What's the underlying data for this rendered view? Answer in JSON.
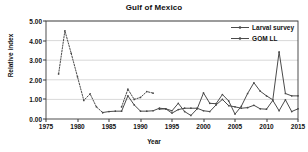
{
  "chart_data": {
    "type": "line",
    "title": "Gulf of Mexico",
    "xlabel": "Year",
    "ylabel": "Relative index",
    "xlim": [
      1975,
      2015
    ],
    "ylim": [
      0.0,
      5.0
    ],
    "xticks": [
      "1975",
      "1980",
      "1985",
      "1990",
      "1995",
      "2000",
      "2005",
      "2010",
      "2015"
    ],
    "xtick_values": [
      1975,
      1980,
      1985,
      1990,
      1995,
      2000,
      2005,
      2010,
      2015
    ],
    "yticks": [
      "0.00",
      "1.00",
      "2.00",
      "3.00",
      "4.00",
      "5.00"
    ],
    "ytick_values": [
      0,
      1,
      2,
      3,
      4,
      5
    ],
    "grid": "horizontal",
    "legend_position": "top-right-inside",
    "line_color": "#4a4a4a",
    "grid_color": "#c8c8c8",
    "axis_color": "#3a3a3a",
    "series": [
      {
        "name": "Larval survey",
        "style": "dotted",
        "marker": "dot",
        "segments": [
          {
            "x": [
              1977,
              1978,
              1979,
              1980,
              1981,
              1982,
              1983,
              1984
            ],
            "y": [
              2.3,
              4.5,
              3.35,
              2.15,
              0.95,
              1.28,
              0.62,
              0.33
            ]
          },
          {
            "x": [
              1987,
              1988,
              1989,
              1990,
              1991,
              1992
            ],
            "y": [
              0.62,
              1.52,
              1.0,
              1.1,
              1.4,
              1.32
            ]
          }
        ]
      },
      {
        "name": "GOM LL",
        "style": "solid",
        "marker": "dot",
        "x": [
          1984,
          1985,
          1986,
          1987,
          1988,
          1989,
          1990,
          1991,
          1992,
          1993,
          1994,
          1995,
          1996,
          1997,
          1998,
          1999,
          2000,
          2001,
          2002,
          2003,
          2004,
          2005,
          2006,
          2007,
          2008,
          2009,
          2010,
          2011,
          2012,
          2013,
          2014,
          2015
        ],
        "y": [
          0.33,
          0.38,
          0.4,
          0.4,
          1.18,
          0.72,
          0.4,
          0.4,
          0.42,
          0.55,
          0.52,
          0.42,
          0.8,
          0.38,
          0.18,
          0.52,
          1.33,
          0.8,
          0.78,
          1.25,
          0.92,
          0.25,
          0.65,
          1.3,
          1.85,
          1.42,
          1.18,
          0.98,
          3.42,
          1.3,
          1.18,
          1.18
        ]
      },
      {
        "name": "GOM LL lower",
        "style": "solid",
        "marker": "dot",
        "x": [
          1993,
          1994,
          1995,
          1996,
          1997,
          1998,
          1999,
          2000,
          2001,
          2002,
          2003,
          2004,
          2005,
          2006,
          2007,
          2008,
          2009,
          2010,
          2011,
          2012,
          2013,
          2014,
          2015
        ],
        "y": [
          0.5,
          0.52,
          0.3,
          0.48,
          0.55,
          0.55,
          0.55,
          0.42,
          0.38,
          0.72,
          1.0,
          0.68,
          0.62,
          0.55,
          0.58,
          0.7,
          0.52,
          0.5,
          0.95,
          0.42,
          0.98,
          0.38,
          0.52
        ]
      }
    ]
  }
}
